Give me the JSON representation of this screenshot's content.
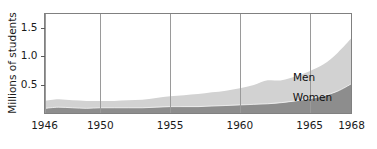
{
  "chart_data": {
    "type": "area",
    "stacked": true,
    "title": "",
    "xlabel": "",
    "ylabel": "Millions of students",
    "xlim": [
      1946,
      1968
    ],
    "ylim": [
      0,
      1.75
    ],
    "grid": false,
    "legend_position": "inline-annotations",
    "x_tick_labels": [
      "1946",
      "1950",
      "1955",
      "1960",
      "1965",
      "1968"
    ],
    "x_ticks": [
      1946,
      1950,
      1955,
      1960,
      1965,
      1968
    ],
    "y_tick_labels": [
      "0.5",
      "1.0",
      "1.5"
    ],
    "y_ticks": [
      0.5,
      1.0,
      1.5
    ],
    "x": [
      1946,
      1947,
      1948,
      1949,
      1950,
      1951,
      1952,
      1953,
      1954,
      1955,
      1956,
      1957,
      1958,
      1959,
      1960,
      1961,
      1962,
      1963,
      1964,
      1965,
      1966,
      1967,
      1968
    ],
    "series": [
      {
        "name": "Women",
        "color": "#8d8d8d",
        "values": [
          0.09,
          0.11,
          0.1,
          0.09,
          0.1,
          0.1,
          0.1,
          0.1,
          0.11,
          0.12,
          0.12,
          0.12,
          0.13,
          0.14,
          0.15,
          0.16,
          0.17,
          0.19,
          0.22,
          0.26,
          0.31,
          0.39,
          0.52
        ]
      },
      {
        "name": "Men",
        "color": "#d2d2d2",
        "values": [
          0.13,
          0.14,
          0.13,
          0.13,
          0.12,
          0.12,
          0.13,
          0.14,
          0.16,
          0.18,
          0.2,
          0.22,
          0.24,
          0.26,
          0.29,
          0.34,
          0.41,
          0.39,
          0.43,
          0.48,
          0.55,
          0.67,
          0.8
        ]
      }
    ],
    "totals": [
      0.22,
      0.25,
      0.23,
      0.22,
      0.22,
      0.22,
      0.23,
      0.24,
      0.27,
      0.3,
      0.32,
      0.34,
      0.37,
      0.4,
      0.44,
      0.5,
      0.58,
      0.58,
      0.65,
      0.74,
      0.86,
      1.06,
      1.32
    ],
    "annotations": [
      {
        "text": "Men",
        "x": 1964.6,
        "y": 0.62
      },
      {
        "text": "Women",
        "x": 1965.2,
        "y": 0.27
      }
    ]
  },
  "axes": {
    "y_title": "Millions of students"
  },
  "colors": {
    "men_band": "#d2d2d2",
    "women_band": "#8d8d8d",
    "frame": "#808080",
    "text": "#111111",
    "background": "#ffffff"
  }
}
